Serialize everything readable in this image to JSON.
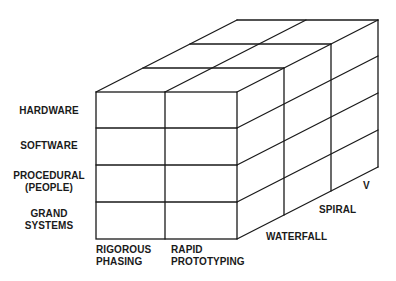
{
  "diagram": {
    "type": "3d-cube-matrix",
    "rows": [
      {
        "label": "HARDWARE"
      },
      {
        "label": "SOFTWARE"
      },
      {
        "label": "PROCEDURAL\n(PEOPLE)",
        "line1": "PROCEDURAL",
        "line2": "(PEOPLE)"
      },
      {
        "label": "GRAND SYSTEMS",
        "line1": "GRAND",
        "line2": "SYSTEMS"
      }
    ],
    "columns": [
      {
        "line1": "RIGOROUS",
        "line2": "PHASING"
      },
      {
        "line1": "RAPID",
        "line2": "PROTOTYPING"
      }
    ],
    "depth": [
      {
        "label": "WATERFALL"
      },
      {
        "label": "SPIRAL"
      },
      {
        "label": "V"
      }
    ],
    "line_color": "#1a1a1a",
    "background": "#ffffff"
  }
}
